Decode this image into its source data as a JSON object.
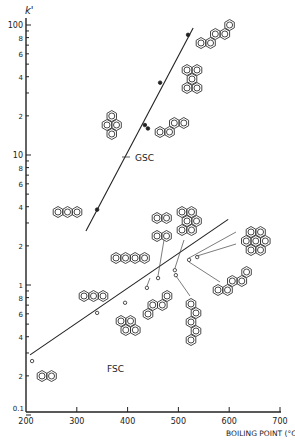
{
  "chart_data": {
    "type": "scatter",
    "title": "",
    "xlabel": "BOILING POINT (°C)",
    "ylabel": "k'",
    "xlim": [
      200,
      700
    ],
    "ylim": [
      0.1,
      100
    ],
    "yscale": "log",
    "x_ticks": [
      "200",
      "300",
      "400",
      "500",
      "600",
      "700"
    ],
    "y_ticks": [
      "0.1",
      "2",
      "4",
      "6",
      "8",
      "1",
      "2",
      "4",
      "6",
      "8",
      "10",
      "2",
      "4",
      "6",
      "8",
      "100"
    ],
    "grid": false,
    "legend": "none (series labeled inline)",
    "series": [
      {
        "name": "GSC",
        "marker": "filled circle",
        "points": [
          {
            "compound": "anthracene",
            "x": 340,
            "y": 3.8
          },
          {
            "compound": "triphenylene",
            "x": 434,
            "y": 17
          },
          {
            "compound": "chrysene",
            "x": 440,
            "y": 16
          },
          {
            "compound": "benzo[ghi]perylene / perylene",
            "x": 464,
            "y": 36
          },
          {
            "compound": "dibenzanthracene (pentaphene)",
            "x": 519,
            "y": 84
          }
        ],
        "fit_line": [
          {
            "x": 318,
            "y": 2.6
          },
          {
            "x": 529,
            "y": 95
          }
        ]
      },
      {
        "name": "FSC",
        "marker": "open circle",
        "points": [
          {
            "compound": "naphthalene",
            "x": 212,
            "y": 0.26
          },
          {
            "compound": "anthracene",
            "x": 340,
            "y": 0.61
          },
          {
            "compound": "pyrene",
            "x": 395,
            "y": 0.73
          },
          {
            "compound": "chrysene",
            "x": 438,
            "y": 0.95
          },
          {
            "compound": "tetracene",
            "x": 460,
            "y": 1.13
          },
          {
            "compound": "perylene",
            "x": 493,
            "y": 1.3
          },
          {
            "compound": "benzo[ghi]perylene",
            "x": 495,
            "y": 1.19
          },
          {
            "compound": "coronene",
            "x": 521,
            "y": 1.56
          },
          {
            "compound": "dibenzanthracene",
            "x": 537,
            "y": 1.64
          }
        ],
        "fit_line": [
          {
            "x": 208,
            "y": 0.29
          },
          {
            "x": 598,
            "y": 3.2
          }
        ]
      }
    ],
    "annotations": [
      "GSC",
      "FSC",
      "polycyclic aromatic hydrocarbon structure drawings next to each point"
    ]
  },
  "labels": {
    "y_axis_title": "k'",
    "x_axis_title": "BOILING POINT (°C)",
    "gsc": "GSC",
    "fsc": "FSC"
  }
}
